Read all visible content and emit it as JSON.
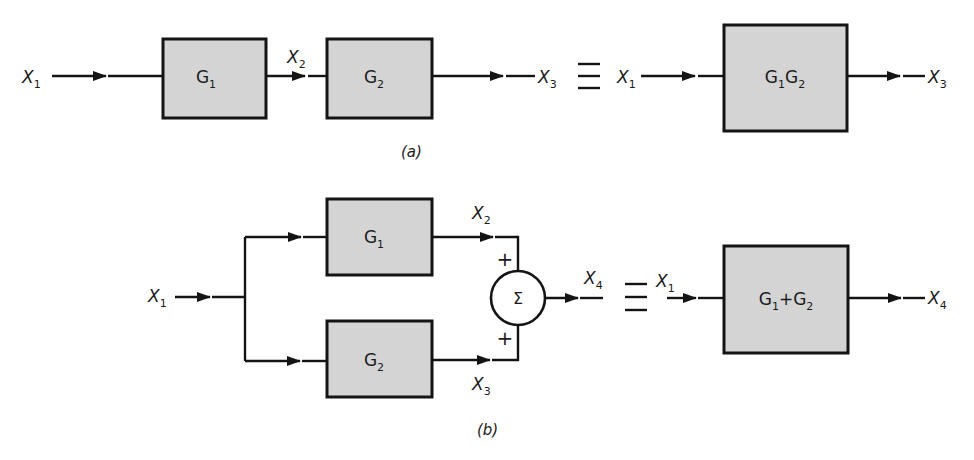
{
  "diagram": {
    "colors": {
      "block_fill": "#d4d4d4",
      "stroke": "#141414",
      "background": "#ffffff"
    },
    "part_a": {
      "caption": "(a)",
      "series": {
        "input": {
          "name": "X",
          "sub": "1"
        },
        "block1": {
          "main": "G",
          "sub": "1"
        },
        "mid": {
          "name": "X",
          "sub": "2"
        },
        "block2": {
          "main": "G",
          "sub": "2"
        },
        "output": {
          "name": "X",
          "sub": "3"
        }
      },
      "equivalence": "≡",
      "equivalent": {
        "input": {
          "name": "X",
          "sub": "1"
        },
        "block": {
          "g1": "G",
          "s1": "1",
          "g2": "G",
          "s2": "2"
        },
        "output": {
          "name": "X",
          "sub": "3"
        }
      }
    },
    "part_b": {
      "caption": "(b)",
      "parallel": {
        "input": {
          "name": "X",
          "sub": "1"
        },
        "block1": {
          "main": "G",
          "sub": "1"
        },
        "block2": {
          "main": "G",
          "sub": "2"
        },
        "out1": {
          "name": "X",
          "sub": "2"
        },
        "out2": {
          "name": "X",
          "sub": "3"
        },
        "sum_symbol": "Σ",
        "sign_top": "+",
        "sign_bottom": "+",
        "output": {
          "name": "X",
          "sub": "4"
        }
      },
      "equivalence": "≡",
      "equivalent": {
        "input": {
          "name": "X",
          "sub": "1"
        },
        "block": {
          "g1": "G",
          "s1": "1",
          "op": "+",
          "g2": "G",
          "s2": "2"
        },
        "output": {
          "name": "X",
          "sub": "4"
        }
      }
    }
  }
}
